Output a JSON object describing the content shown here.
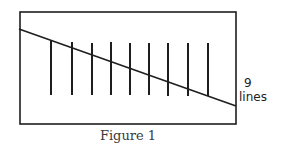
{
  "figure": {
    "caption": "Figure 1",
    "annotation_count": "9",
    "annotation_word": "lines",
    "stroke_color": "#1e1e1e",
    "frame": {
      "x1": 20,
      "y1": 12,
      "x2": 236,
      "y2": 124
    },
    "diagonal": {
      "x1": 19,
      "y1": 29,
      "x2": 236,
      "y2": 106
    },
    "vertical_lines": [
      {
        "x": 51,
        "y1": 41,
        "y2": 95
      },
      {
        "x": 72,
        "y1": 42,
        "y2": 95
      },
      {
        "x": 92,
        "y1": 43,
        "y2": 95
      },
      {
        "x": 111,
        "y1": 42,
        "y2": 95
      },
      {
        "x": 130,
        "y1": 43,
        "y2": 95
      },
      {
        "x": 149,
        "y1": 43,
        "y2": 95
      },
      {
        "x": 168,
        "y1": 43,
        "y2": 96
      },
      {
        "x": 188,
        "y1": 43,
        "y2": 96
      },
      {
        "x": 208,
        "y1": 43,
        "y2": 96
      }
    ]
  }
}
